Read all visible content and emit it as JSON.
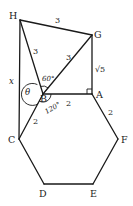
{
  "vertices": {
    "H": "H",
    "G": "G",
    "A": "A",
    "B": "B",
    "C": "C",
    "D": "D",
    "E": "E",
    "F": "F"
  },
  "measures": {
    "HG": "3",
    "HB": "3",
    "BG": "3",
    "GA": "√5",
    "BA": "2",
    "BC": "2",
    "AF": "2",
    "HC": "x"
  },
  "angles": {
    "theta": "θ",
    "HBG": "60°",
    "ABC": "120°",
    "BAG": "right-angle"
  }
}
